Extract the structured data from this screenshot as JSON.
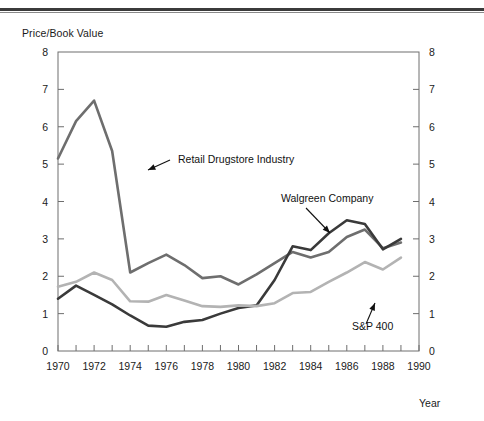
{
  "figure": {
    "ylabel": "Price/Book Value",
    "xlabel": "Year"
  },
  "chart_data": {
    "type": "line",
    "title": "",
    "subtitle": "",
    "xlabel": "Year",
    "ylabel": "Price/Book Value",
    "xlim": [
      1970,
      1990
    ],
    "ylim": [
      0,
      8
    ],
    "grid": false,
    "legend": "annotations-on-plot",
    "right_axis_mirrors_left": true,
    "x_tick_labels": [
      "1970",
      "1972",
      "1974",
      "1976",
      "1978",
      "1980",
      "1982",
      "1984",
      "1986",
      "1988",
      "1990"
    ],
    "x_ticks": [
      1970,
      1971,
      1972,
      1973,
      1974,
      1975,
      1976,
      1977,
      1978,
      1979,
      1980,
      1981,
      1982,
      1983,
      1984,
      1985,
      1986,
      1987,
      1988,
      1989,
      1990
    ],
    "y_tick_labels": [
      "0",
      "1",
      "2",
      "3",
      "4",
      "5",
      "6",
      "7",
      "8"
    ],
    "y_ticks": [
      0,
      1,
      2,
      3,
      4,
      5,
      6,
      7,
      8
    ],
    "x": [
      1970,
      1971,
      1972,
      1973,
      1974,
      1975,
      1976,
      1977,
      1978,
      1979,
      1980,
      1981,
      1982,
      1983,
      1984,
      1985,
      1986,
      1987,
      1988,
      1989
    ],
    "series": [
      {
        "name": "Retail Drugstore Industry",
        "color": "#6e6e6e",
        "values": [
          5.15,
          6.15,
          6.7,
          5.35,
          2.1,
          2.35,
          2.58,
          2.3,
          1.95,
          2.0,
          1.78,
          2.05,
          2.35,
          2.65,
          2.5,
          2.65,
          3.05,
          3.25,
          2.75,
          2.9
        ]
      },
      {
        "name": "Walgreen Company",
        "color": "#3a3a3a",
        "values": [
          1.4,
          1.75,
          1.5,
          1.25,
          0.95,
          0.68,
          0.65,
          0.78,
          0.83,
          1.0,
          1.15,
          1.22,
          1.9,
          2.8,
          2.7,
          3.15,
          3.5,
          3.4,
          2.72,
          3.0
        ]
      },
      {
        "name": "S&P 400",
        "color": "#b3b3b3",
        "values": [
          1.72,
          1.85,
          2.1,
          1.9,
          1.33,
          1.32,
          1.5,
          1.35,
          1.2,
          1.18,
          1.22,
          1.2,
          1.28,
          1.55,
          1.58,
          1.85,
          2.1,
          2.38,
          2.18,
          2.5
        ]
      }
    ],
    "annotations": [
      {
        "text": "Retail Drugstore Industry",
        "target_series": "Retail Drugstore Industry"
      },
      {
        "text": "Walgreen Company",
        "target_series": "Walgreen Company"
      },
      {
        "text": "S&P 400",
        "target_series": "S&P 400"
      }
    ]
  }
}
